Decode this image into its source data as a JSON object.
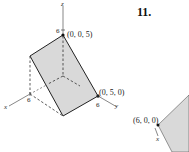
{
  "exercise": {
    "number": "11."
  },
  "figure_left": {
    "axes": {
      "x": "x",
      "y": "y",
      "z": "z"
    },
    "ticks": {
      "z": "6",
      "x": "6",
      "y": "6"
    },
    "points": [
      {
        "label": "(0, 0, 5)"
      },
      {
        "label": "(0, 5, 0)"
      }
    ],
    "fill_color": "#d9d9d9",
    "line_color": "#222222"
  },
  "figure_right": {
    "axes": {
      "x": "x"
    },
    "points": [
      {
        "label": "(6, 0, 0)"
      }
    ],
    "fill_color": "#d9d9d9"
  }
}
